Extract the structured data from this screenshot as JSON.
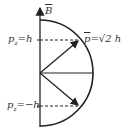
{
  "diagram": {
    "axis_label": "B",
    "axis_label_has_vector_bar": true,
    "vector_label": "p = √2 h",
    "vector_label_parts": {
      "symbol": "p",
      "eq": "=",
      "value": "√2 h"
    },
    "upper_projection": {
      "symbol": "p",
      "subscript": "z",
      "value": "=h"
    },
    "lower_projection": {
      "symbol": "p",
      "subscript": "z",
      "value": "=−h"
    },
    "colors": {
      "line": "#222222",
      "text": "#333333",
      "background": "#ffffff"
    },
    "geometry": {
      "origin": [
        40,
        73
      ],
      "radius": 53,
      "arrows": [
        {
          "to": [
            79,
            40
          ],
          "label": "upper"
        },
        {
          "to": [
            93,
            73
          ],
          "label": "horizontal"
        },
        {
          "to": [
            79,
            106
          ],
          "label": "lower"
        }
      ]
    }
  }
}
